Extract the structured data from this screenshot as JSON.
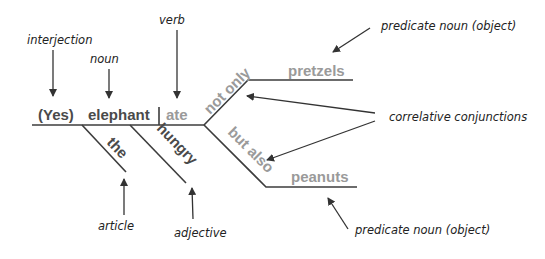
{
  "diagram": {
    "type": "sentence-diagram",
    "sentence_words": {
      "interjection": "(Yes)",
      "subject": "elephant",
      "verb": "ate",
      "modifier_article": "the",
      "modifier_adjective": "hungry",
      "conj_upper": "not only",
      "conj_lower": "but also",
      "object_upper": "pretzels",
      "object_lower": "peanuts"
    },
    "labels": {
      "interjection": "interjection",
      "noun": "noun",
      "verb": "verb",
      "article": "article",
      "adjective": "adjective",
      "predicate_upper": "predicate noun (object)",
      "predicate_lower": "predicate noun (object)",
      "correlative": "correlative conjunctions"
    },
    "colors": {
      "dark_word": "#4a4a4a",
      "light_word": "#9a9a9a",
      "label": "#222222",
      "line": "#3c3c3c"
    }
  }
}
